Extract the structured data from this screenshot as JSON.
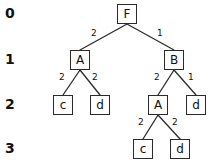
{
  "diagram": {
    "level_labels": [
      {
        "text": "0",
        "x": 5,
        "y": 6
      },
      {
        "text": "1",
        "x": 5,
        "y": 52
      },
      {
        "text": "2",
        "x": 5,
        "y": 97
      },
      {
        "text": "3",
        "x": 5,
        "y": 141
      }
    ],
    "nodes": [
      {
        "id": "root-F",
        "label": "F",
        "level": 0,
        "x": 117,
        "y": 4
      },
      {
        "id": "left-A",
        "label": "A",
        "level": 1,
        "x": 70,
        "y": 50
      },
      {
        "id": "right-B",
        "label": "B",
        "level": 1,
        "x": 164,
        "y": 50
      },
      {
        "id": "left-c",
        "label": "c",
        "level": 2,
        "x": 53,
        "y": 95
      },
      {
        "id": "left-d",
        "label": "d",
        "level": 2,
        "x": 90,
        "y": 95
      },
      {
        "id": "mid-A",
        "label": "A",
        "level": 2,
        "x": 148,
        "y": 95
      },
      {
        "id": "right-d",
        "label": "d",
        "level": 2,
        "x": 186,
        "y": 95
      },
      {
        "id": "bottom-c",
        "label": "c",
        "level": 3,
        "x": 133,
        "y": 139
      },
      {
        "id": "bottom-d",
        "label": "d",
        "level": 3,
        "x": 170,
        "y": 139
      }
    ],
    "edges": [
      {
        "id": "F-A",
        "from": "root-F",
        "to": "left-A",
        "weight": "2",
        "x1": 127,
        "y1": 24,
        "x2": 80,
        "y2": 50,
        "label_x": 91,
        "label_y": 29
      },
      {
        "id": "F-B",
        "from": "root-F",
        "to": "right-B",
        "weight": "1",
        "x1": 127,
        "y1": 24,
        "x2": 174,
        "y2": 50,
        "label_x": 157,
        "label_y": 29
      },
      {
        "id": "A-c",
        "from": "left-A",
        "to": "left-c",
        "weight": "2",
        "x1": 80,
        "y1": 70,
        "x2": 63,
        "y2": 95,
        "label_x": 59,
        "label_y": 73
      },
      {
        "id": "A-d",
        "from": "left-A",
        "to": "left-d",
        "weight": "2",
        "x1": 80,
        "y1": 70,
        "x2": 100,
        "y2": 95,
        "label_x": 92,
        "label_y": 73
      },
      {
        "id": "B-A",
        "from": "right-B",
        "to": "mid-A",
        "weight": "2",
        "x1": 174,
        "y1": 70,
        "x2": 158,
        "y2": 95,
        "label_x": 154,
        "label_y": 73
      },
      {
        "id": "B-d",
        "from": "right-B",
        "to": "right-d",
        "weight": "1",
        "x1": 174,
        "y1": 70,
        "x2": 196,
        "y2": 95,
        "label_x": 188,
        "label_y": 73
      },
      {
        "id": "A2-c",
        "from": "mid-A",
        "to": "bottom-c",
        "weight": "2",
        "x1": 158,
        "y1": 115,
        "x2": 143,
        "y2": 139,
        "label_x": 138,
        "label_y": 118
      },
      {
        "id": "A2-d",
        "from": "mid-A",
        "to": "bottom-d",
        "weight": "2",
        "x1": 158,
        "y1": 115,
        "x2": 180,
        "y2": 139,
        "label_x": 172,
        "label_y": 118
      }
    ],
    "colors": {
      "stroke": "#2b2b2b",
      "text": "#111111",
      "background": "#ffffff"
    }
  }
}
